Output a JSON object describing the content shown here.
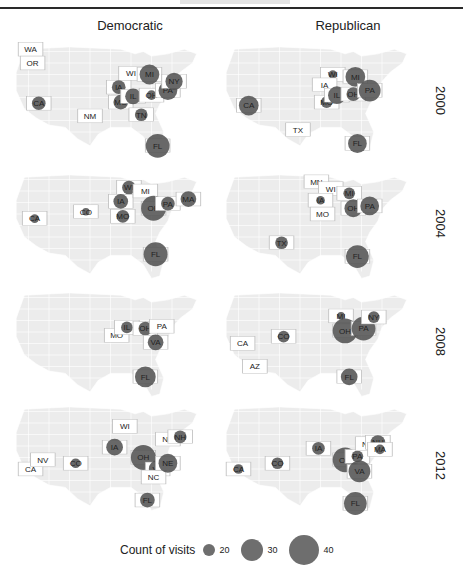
{
  "figure": {
    "columns": [
      "Democratic",
      "Republican"
    ],
    "rows": [
      "2000",
      "2004",
      "2008",
      "2012"
    ],
    "legend": {
      "title": "Count of visits",
      "entries": [
        {
          "label": "20",
          "size": 12
        },
        {
          "label": "30",
          "size": 22
        },
        {
          "label": "40",
          "size": 30
        }
      ]
    },
    "colors": {
      "map_fill": "#ececec",
      "map_border": "#ffffff",
      "highlight_fill": "#ffffff",
      "highlight_border": "#bdbdbd",
      "bubble": "#4d4d4d",
      "text": "#222222"
    }
  },
  "chart_data": {
    "type": "scatter",
    "subtype": "faceted bubble map (US states)",
    "title": "",
    "facet_columns": [
      "Democratic",
      "Republican"
    ],
    "facet_rows": [
      "2000",
      "2004",
      "2008",
      "2012"
    ],
    "size_legend": {
      "title": "Count of visits",
      "breaks": [
        20,
        30,
        40
      ]
    },
    "panels": [
      {
        "party": "Democratic",
        "year": "2000",
        "states": [
          {
            "state": "WA",
            "visits": 0,
            "x": 11,
            "y": 8,
            "bubble": false
          },
          {
            "state": "OR",
            "visits": 2,
            "x": 12,
            "y": 20,
            "bubble": false
          },
          {
            "state": "CA",
            "visits": 18,
            "x": 15,
            "y": 55,
            "bubble": true
          },
          {
            "state": "NM",
            "visits": 0,
            "x": 40,
            "y": 66,
            "bubble": false
          },
          {
            "state": "WI",
            "visits": 5,
            "x": 60,
            "y": 29,
            "bubble": false
          },
          {
            "state": "IA",
            "visits": 18,
            "x": 54,
            "y": 41,
            "bubble": true
          },
          {
            "state": "MO",
            "visits": 20,
            "x": 55,
            "y": 54,
            "bubble": true
          },
          {
            "state": "IL",
            "visits": 22,
            "x": 61,
            "y": 49,
            "bubble": true
          },
          {
            "state": "MI",
            "visits": 30,
            "x": 69,
            "y": 30,
            "bubble": true
          },
          {
            "state": "OH",
            "visits": 10,
            "x": 70,
            "y": 48,
            "bubble": true
          },
          {
            "state": "PA",
            "visits": 28,
            "x": 78,
            "y": 44,
            "bubble": true
          },
          {
            "state": "NY",
            "visits": 25,
            "x": 81,
            "y": 36,
            "bubble": true
          },
          {
            "state": "TN",
            "visits": 16,
            "x": 65,
            "y": 65,
            "bubble": true
          },
          {
            "state": "FL",
            "visits": 38,
            "x": 73,
            "y": 92,
            "bubble": true
          }
        ]
      },
      {
        "party": "Republican",
        "year": "2000",
        "states": [
          {
            "state": "CA",
            "visits": 30,
            "x": 15,
            "y": 57,
            "bubble": true
          },
          {
            "state": "TX",
            "visits": 2,
            "x": 39,
            "y": 78,
            "bubble": false
          },
          {
            "state": "WI",
            "visits": 8,
            "x": 56,
            "y": 30,
            "bubble": true
          },
          {
            "state": "IA",
            "visits": 2,
            "x": 52,
            "y": 39,
            "bubble": false
          },
          {
            "state": "MO",
            "visits": 14,
            "x": 53,
            "y": 54,
            "bubble": true
          },
          {
            "state": "IL",
            "visits": 26,
            "x": 58,
            "y": 48,
            "bubble": true
          },
          {
            "state": "MI",
            "visits": 30,
            "x": 67,
            "y": 32,
            "bubble": true
          },
          {
            "state": "OH",
            "visits": 18,
            "x": 66,
            "y": 47,
            "bubble": true
          },
          {
            "state": "PA",
            "visits": 34,
            "x": 74,
            "y": 44,
            "bubble": true
          },
          {
            "state": "FL",
            "visits": 28,
            "x": 68,
            "y": 90,
            "bubble": true
          }
        ]
      },
      {
        "party": "Democratic",
        "year": "2004",
        "states": [
          {
            "state": "CA",
            "visits": 8,
            "x": 13,
            "y": 44,
            "bubble": true
          },
          {
            "state": "CO",
            "visits": 6,
            "x": 38,
            "y": 38,
            "bubble": true
          },
          {
            "state": "WI",
            "visits": 18,
            "x": 59,
            "y": 17,
            "bubble": true
          },
          {
            "state": "IA",
            "visits": 20,
            "x": 55,
            "y": 29,
            "bubble": true
          },
          {
            "state": "MO",
            "visits": 16,
            "x": 56,
            "y": 42,
            "bubble": true
          },
          {
            "state": "MI",
            "visits": 0,
            "x": 67,
            "y": 20,
            "bubble": false
          },
          {
            "state": "OH",
            "visits": 40,
            "x": 71,
            "y": 35,
            "bubble": true
          },
          {
            "state": "PA",
            "visits": 18,
            "x": 78,
            "y": 31,
            "bubble": true
          },
          {
            "state": "MA",
            "visits": 22,
            "x": 88,
            "y": 27,
            "bubble": true
          },
          {
            "state": "FL",
            "visits": 38,
            "x": 72,
            "y": 75,
            "bubble": true
          }
        ]
      },
      {
        "party": "Republican",
        "year": "2004",
        "states": [
          {
            "state": "MN",
            "visits": 0,
            "x": 48,
            "y": 12,
            "bubble": false
          },
          {
            "state": "WI",
            "visits": 0,
            "x": 55,
            "y": 18,
            "bubble": false
          },
          {
            "state": "IA",
            "visits": 8,
            "x": 50,
            "y": 28,
            "bubble": true
          },
          {
            "state": "MO",
            "visits": 0,
            "x": 51,
            "y": 40,
            "bubble": false
          },
          {
            "state": "MI",
            "visits": 14,
            "x": 64,
            "y": 22,
            "bubble": true
          },
          {
            "state": "OH",
            "visits": 26,
            "x": 66,
            "y": 35,
            "bubble": true
          },
          {
            "state": "PA",
            "visits": 28,
            "x": 74,
            "y": 33,
            "bubble": true
          },
          {
            "state": "TX",
            "visits": 16,
            "x": 31,
            "y": 65,
            "bubble": true
          },
          {
            "state": "FL",
            "visits": 36,
            "x": 68,
            "y": 77,
            "bubble": true
          }
        ]
      },
      {
        "party": "Democratic",
        "year": "2008",
        "states": [
          {
            "state": "MO",
            "visits": 0,
            "x": 53,
            "y": 43,
            "bubble": false
          },
          {
            "state": "IL",
            "visits": 14,
            "x": 58,
            "y": 36,
            "bubble": true
          },
          {
            "state": "OH",
            "visits": 18,
            "x": 67,
            "y": 37,
            "bubble": true
          },
          {
            "state": "PA",
            "visits": 0,
            "x": 75,
            "y": 35,
            "bubble": false
          },
          {
            "state": "VA",
            "visits": 22,
            "x": 72,
            "y": 49,
            "bubble": true
          },
          {
            "state": "FL",
            "visits": 32,
            "x": 67,
            "y": 79,
            "bubble": true
          }
        ]
      },
      {
        "party": "Republican",
        "year": "2008",
        "states": [
          {
            "state": "CA",
            "visits": 0,
            "x": 12,
            "y": 50,
            "bubble": false
          },
          {
            "state": "AZ",
            "visits": 2,
            "x": 18,
            "y": 70,
            "bubble": false
          },
          {
            "state": "CO",
            "visits": 14,
            "x": 32,
            "y": 44,
            "bubble": true
          },
          {
            "state": "MI",
            "visits": 6,
            "x": 60,
            "y": 26,
            "bubble": true
          },
          {
            "state": "OH",
            "visits": 40,
            "x": 62,
            "y": 39,
            "bubble": true
          },
          {
            "state": "PA",
            "visits": 38,
            "x": 71,
            "y": 37,
            "bubble": true
          },
          {
            "state": "NY",
            "visits": 14,
            "x": 76,
            "y": 27,
            "bubble": true
          },
          {
            "state": "FL",
            "visits": 24,
            "x": 64,
            "y": 79,
            "bubble": true
          }
        ]
      },
      {
        "party": "Democratic",
        "year": "2012",
        "states": [
          {
            "state": "CA",
            "visits": 2,
            "x": 11,
            "y": 60,
            "bubble": false
          },
          {
            "state": "NV",
            "visits": 2,
            "x": 17,
            "y": 52,
            "bubble": false
          },
          {
            "state": "CO",
            "visits": 10,
            "x": 33,
            "y": 55,
            "bubble": true
          },
          {
            "state": "WI",
            "visits": 0,
            "x": 57,
            "y": 23,
            "bubble": false
          },
          {
            "state": "IA",
            "visits": 24,
            "x": 52,
            "y": 41,
            "bubble": true
          },
          {
            "state": "OH",
            "visits": 40,
            "x": 66,
            "y": 50,
            "bubble": true
          },
          {
            "state": "VA",
            "visits": 26,
            "x": 73,
            "y": 60,
            "bubble": true
          },
          {
            "state": "NC",
            "visits": 2,
            "x": 71,
            "y": 67,
            "bubble": false
          },
          {
            "state": "NE",
            "visits": 28,
            "x": 78,
            "y": 55,
            "bubble": true
          },
          {
            "state": "NY",
            "visits": 0,
            "x": 78,
            "y": 34,
            "bubble": false
          },
          {
            "state": "NH",
            "visits": 16,
            "x": 84,
            "y": 32,
            "bubble": true
          },
          {
            "state": "FL",
            "visits": 20,
            "x": 68,
            "y": 87,
            "bubble": true
          }
        ]
      },
      {
        "party": "Republican",
        "year": "2012",
        "states": [
          {
            "state": "CA",
            "visits": 10,
            "x": 10,
            "y": 60,
            "bubble": true
          },
          {
            "state": "CO",
            "visits": 14,
            "x": 29,
            "y": 55,
            "bubble": true
          },
          {
            "state": "IA",
            "visits": 16,
            "x": 49,
            "y": 42,
            "bubble": true
          },
          {
            "state": "OH",
            "visits": 40,
            "x": 62,
            "y": 52,
            "bubble": true
          },
          {
            "state": "PA",
            "visits": 14,
            "x": 68,
            "y": 49,
            "bubble": true
          },
          {
            "state": "VA",
            "visits": 34,
            "x": 69,
            "y": 62,
            "bubble": true
          },
          {
            "state": "NY",
            "visits": 0,
            "x": 73,
            "y": 38,
            "bubble": false
          },
          {
            "state": "NH",
            "visits": 20,
            "x": 78,
            "y": 37,
            "bubble": true
          },
          {
            "state": "MA",
            "visits": 10,
            "x": 79,
            "y": 43,
            "bubble": true
          },
          {
            "state": "FL",
            "visits": 36,
            "x": 67,
            "y": 90,
            "bubble": true
          }
        ]
      }
    ]
  }
}
